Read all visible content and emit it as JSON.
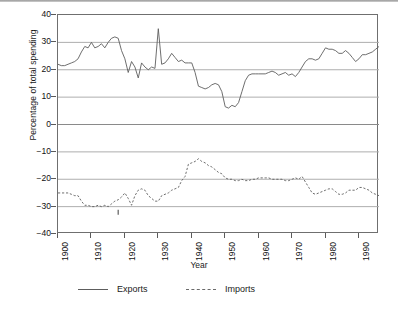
{
  "chart_data": {
    "type": "line",
    "title": "",
    "xlabel": "Year",
    "ylabel": "Percentage of total spending",
    "xlim": [
      1900,
      1996
    ],
    "ylim": [
      -40,
      40
    ],
    "yticks": [
      40,
      30,
      20,
      10,
      0,
      -10,
      -20,
      -30,
      -40
    ],
    "ytick_labels": [
      "40",
      "30",
      "20",
      "10",
      "0",
      "−10",
      "−20",
      "−30",
      "−40"
    ],
    "xticks": [
      1900,
      1910,
      1920,
      1930,
      1940,
      1950,
      1960,
      1970,
      1980,
      1990
    ],
    "xtick_labels": [
      "1900",
      "1910",
      "1920",
      "1930",
      "1940",
      "1950",
      "1960",
      "1970",
      "1980",
      "1990"
    ],
    "gridlines_y": [
      30,
      20,
      10,
      0,
      -10,
      -20,
      -30
    ],
    "grid": true,
    "legend_position": "below",
    "legend": [
      {
        "name": "Exports",
        "style": "solid"
      },
      {
        "name": "Imports",
        "style": "dashed"
      }
    ],
    "x": [
      1900,
      1901,
      1902,
      1903,
      1904,
      1905,
      1906,
      1907,
      1908,
      1909,
      1910,
      1911,
      1912,
      1913,
      1914,
      1915,
      1916,
      1917,
      1918,
      1919,
      1920,
      1921,
      1922,
      1923,
      1924,
      1925,
      1926,
      1927,
      1928,
      1929,
      1930,
      1931,
      1932,
      1933,
      1934,
      1935,
      1936,
      1937,
      1938,
      1939,
      1940,
      1941,
      1942,
      1943,
      1944,
      1945,
      1946,
      1947,
      1948,
      1949,
      1950,
      1951,
      1952,
      1953,
      1954,
      1955,
      1956,
      1957,
      1958,
      1959,
      1960,
      1961,
      1962,
      1963,
      1964,
      1965,
      1966,
      1967,
      1968,
      1969,
      1970,
      1971,
      1972,
      1973,
      1974,
      1975,
      1976,
      1977,
      1978,
      1979,
      1980,
      1981,
      1982,
      1983,
      1984,
      1985,
      1986,
      1987,
      1988,
      1989,
      1990,
      1991,
      1992,
      1993,
      1994,
      1995,
      1996
    ],
    "series": [
      {
        "name": "Exports",
        "style": "solid",
        "values": [
          22,
          21.5,
          21.5,
          22,
          22.5,
          23,
          24,
          26.5,
          28.5,
          28,
          30,
          28,
          28.5,
          29.5,
          28,
          30,
          31.5,
          32,
          31.5,
          27,
          24,
          19,
          23,
          21,
          17,
          22.5,
          21,
          20,
          21,
          20.5,
          35,
          22,
          22.5,
          24,
          26,
          24.5,
          23,
          23.5,
          22.5,
          22.5,
          22.5,
          19,
          14,
          13.5,
          13,
          13.5,
          14.5,
          15,
          14.5,
          12,
          6.5,
          6,
          7,
          6.5,
          8,
          12,
          16,
          18,
          18.5,
          18.5,
          18.5,
          18.5,
          18.5,
          19,
          19.5,
          19,
          18,
          18.5,
          19,
          18,
          18.5,
          17.5,
          19,
          21,
          23,
          24,
          24,
          23.5,
          24,
          26,
          28,
          27.5,
          27.5,
          27,
          26,
          26,
          27,
          26,
          24.5,
          23,
          24,
          25.5,
          25.5,
          26,
          26.5,
          27.5,
          28.5
        ]
      },
      {
        "name": "Imports",
        "style": "dashed",
        "values": [
          -25,
          -25,
          -25,
          -25,
          -25.5,
          -26,
          -26,
          -28,
          -29.5,
          -29.5,
          -30,
          -30,
          -29.5,
          -30,
          -29.5,
          -30,
          -29,
          -28,
          -27.5,
          -26.5,
          -25,
          -27,
          -29.5,
          -26,
          -24,
          -23.5,
          -24,
          -26,
          -27,
          -28,
          -28,
          -26,
          -25.5,
          -25,
          -24,
          -23.5,
          -23,
          -20.5,
          -19,
          -14.5,
          -14,
          -13.5,
          -12.5,
          -13.5,
          -14,
          -15,
          -15.5,
          -16.5,
          -17.5,
          -18,
          -19.5,
          -20,
          -20,
          -20.5,
          -20.5,
          -20,
          -20.5,
          -20.5,
          -20,
          -20,
          -19.5,
          -19.5,
          -19.5,
          -19.5,
          -20,
          -20,
          -20,
          -20,
          -20.5,
          -20.5,
          -20,
          -19.5,
          -20,
          -19,
          -21,
          -23,
          -25,
          -25.5,
          -25,
          -24.5,
          -24,
          -23.5,
          -23.5,
          -24.5,
          -25.5,
          -25.5,
          -25,
          -24,
          -24,
          -24,
          -23,
          -23,
          -23.5,
          -24,
          -25,
          -25.5,
          -26
        ]
      }
    ],
    "annotation_marks": [
      {
        "series": "Imports",
        "x": 1918,
        "y": -33,
        "note": "tick mark below axis line"
      }
    ]
  }
}
